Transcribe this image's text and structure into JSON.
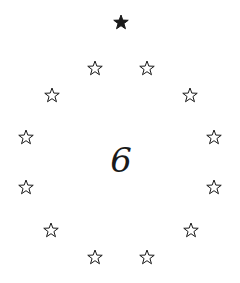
{
  "center_number": "6",
  "colors": {
    "ink": "#1a1a1a",
    "background": "#ffffff"
  },
  "stars": [
    {
      "x": 121,
      "y": 22,
      "filled": true,
      "icon": "star-filled-icon"
    },
    {
      "x": 95,
      "y": 68,
      "filled": false,
      "icon": "star-outline-icon"
    },
    {
      "x": 147,
      "y": 68,
      "filled": false,
      "icon": "star-outline-icon"
    },
    {
      "x": 52,
      "y": 95,
      "filled": false,
      "icon": "star-outline-icon"
    },
    {
      "x": 190,
      "y": 95,
      "filled": false,
      "icon": "star-outline-icon"
    },
    {
      "x": 26,
      "y": 137,
      "filled": false,
      "icon": "star-outline-icon"
    },
    {
      "x": 214,
      "y": 137,
      "filled": false,
      "icon": "star-outline-icon"
    },
    {
      "x": 26,
      "y": 187,
      "filled": false,
      "icon": "star-outline-icon"
    },
    {
      "x": 214,
      "y": 187,
      "filled": false,
      "icon": "star-outline-icon"
    },
    {
      "x": 51,
      "y": 230,
      "filled": false,
      "icon": "star-outline-icon"
    },
    {
      "x": 191,
      "y": 230,
      "filled": false,
      "icon": "star-outline-icon"
    },
    {
      "x": 95,
      "y": 257,
      "filled": false,
      "icon": "star-outline-icon"
    },
    {
      "x": 147,
      "y": 257,
      "filled": false,
      "icon": "star-outline-icon"
    }
  ]
}
